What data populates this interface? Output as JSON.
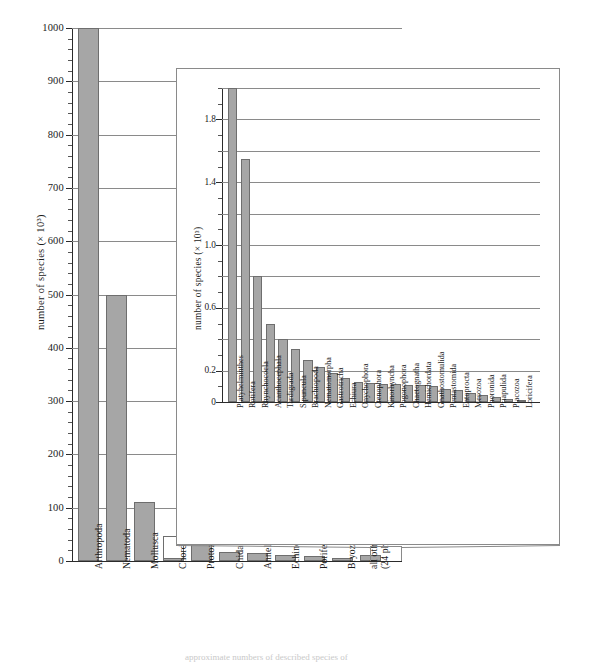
{
  "figure": {
    "caption": "approximate numbers of described species of"
  },
  "chart_data": [
    {
      "type": "bar",
      "id": "main",
      "title": "",
      "xlabel": "",
      "ylabel": "number of species (× 10³)",
      "ylim": [
        0,
        1000
      ],
      "yticks": [
        0,
        100,
        200,
        300,
        400,
        500,
        600,
        700,
        800,
        900,
        1000
      ],
      "ytick_labels": [
        "0",
        "100",
        "200",
        "300",
        "400",
        "500",
        "600",
        "700",
        "800",
        "900",
        "1000"
      ],
      "minor_tick_step": 20,
      "grid": true,
      "categories": [
        "Arthropoda",
        "Nematoda",
        "Mollusca",
        "Chordata",
        "Protozoa",
        "Cnidaria",
        "Annelida",
        "Echinodermata",
        "Porifera",
        "Bryozoa",
        "all others\n(24 phyla)"
      ],
      "values": [
        1000,
        500,
        110,
        47,
        35,
        16,
        15,
        11,
        10,
        5,
        12
      ],
      "bar_styles": [
        "filled",
        "filled",
        "filled",
        "hollow",
        "filled",
        "filled",
        "filled",
        "filled",
        "filled",
        "filled",
        "filled"
      ],
      "chordata_base_value": 5,
      "clipped_bars": [
        "Arthropoda"
      ],
      "note_all_others": "expanded in inset"
    },
    {
      "type": "bar",
      "id": "inset",
      "title": "",
      "xlabel": "",
      "ylabel": "number of species (× 10³)",
      "ylim": [
        0,
        2.0
      ],
      "yticks": [
        0,
        0.2,
        0.6,
        1.0,
        1.4,
        1.8
      ],
      "ytick_labels": [
        "0",
        "0.2",
        "0.6",
        "1.0",
        "1.4",
        "1.8"
      ],
      "gridline_step": 0.2,
      "grid": true,
      "categories": [
        "Platyhelminthes",
        "Rotifera",
        "Rhynchocoela",
        "Acanthocephala",
        "Tardigrada",
        "Sipuncula",
        "Brachiopoda",
        "Nematomorpha",
        "Gastrotricha",
        "Echiura",
        "Onychophora",
        "Ctenophora",
        "Kinorhyncha",
        "Pogonophora",
        "Chaetognatha",
        "Hemichordata",
        "Gnathostomulida",
        "Pentastomida",
        "Entoprocta",
        "Mesozoa",
        "Phoronida",
        "Priapulida",
        "Placozoa",
        "Loricifera"
      ],
      "values": [
        2.0,
        1.55,
        0.8,
        0.5,
        0.4,
        0.34,
        0.27,
        0.22,
        0.185,
        0.15,
        0.13,
        0.12,
        0.115,
        0.112,
        0.11,
        0.108,
        0.105,
        0.085,
        0.075,
        0.06,
        0.045,
        0.03,
        0.018,
        0.012
      ],
      "clipped_bars": [
        "Platyhelminthes"
      ]
    }
  ],
  "colors": {
    "bar_fill": "#a6a6a6",
    "bar_edge": "#6e6e6e",
    "grid": "#8a8a8a",
    "axis": "#2b2b2b",
    "hollow_fill": "#ffffff"
  }
}
